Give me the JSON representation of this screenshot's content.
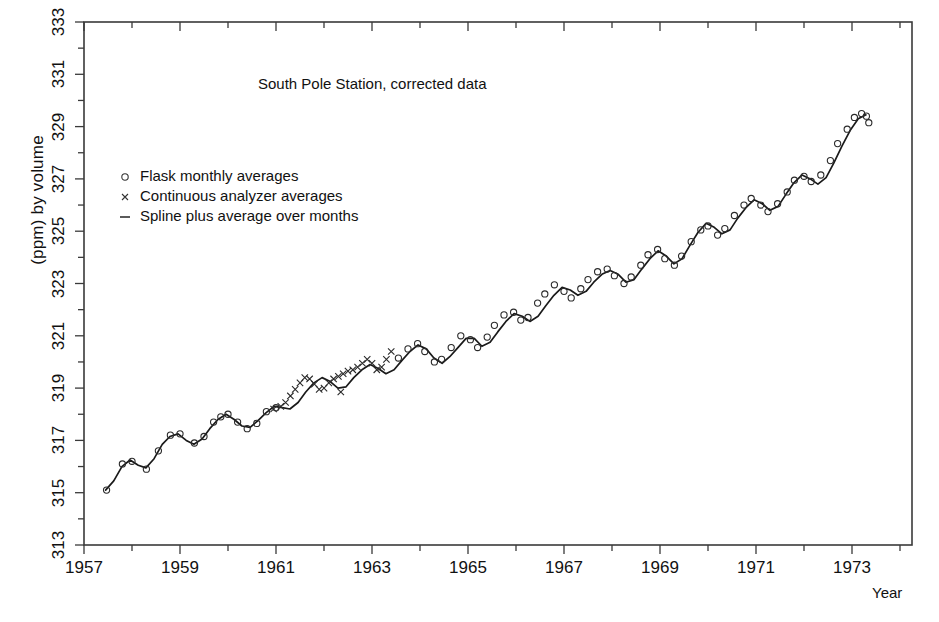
{
  "chart_data": {
    "type": "line",
    "title": "South Pole Station, corrected data",
    "xlabel": "Year",
    "ylabel": "(ppm) by volume",
    "xlim": [
      1957.0,
      1974.25
    ],
    "ylim": [
      313,
      333
    ],
    "grid": false,
    "legend_position": "upper-left-inside",
    "x_major_ticks": [
      1957,
      1959,
      1961,
      1963,
      1965,
      1967,
      1969,
      1971,
      1973
    ],
    "x_minor_ticks": [
      1958,
      1960,
      1962,
      1964,
      1966,
      1968,
      1970,
      1972,
      1974
    ],
    "y_major_ticks": [
      313,
      315,
      317,
      319,
      321,
      323,
      325,
      327,
      329,
      331,
      333
    ],
    "y_minor_ticks": [
      314,
      316,
      318,
      320,
      322,
      324,
      326,
      328,
      330,
      332
    ],
    "legend": [
      {
        "marker": "circle",
        "label": "Flask monthly averages"
      },
      {
        "marker": "cross",
        "label": "Continuous analyzer averages"
      },
      {
        "marker": "dash",
        "label": "Spline plus average over months"
      }
    ],
    "series": [
      {
        "name": "Spline plus average over months",
        "marker": "none",
        "style": "solid-line",
        "x": [
          1957.45,
          1957.62,
          1957.79,
          1957.96,
          1958.13,
          1958.29,
          1958.46,
          1958.63,
          1958.79,
          1958.96,
          1959.13,
          1959.29,
          1959.46,
          1959.62,
          1959.79,
          1959.96,
          1960.13,
          1960.29,
          1960.46,
          1960.62,
          1960.79,
          1960.96,
          1961.13,
          1961.29,
          1961.46,
          1961.62,
          1961.79,
          1961.96,
          1962.13,
          1962.29,
          1962.46,
          1962.62,
          1962.79,
          1962.96,
          1963.13,
          1963.29,
          1963.46,
          1963.62,
          1963.79,
          1963.96,
          1964.13,
          1964.29,
          1964.46,
          1964.62,
          1964.79,
          1964.96,
          1965.13,
          1965.29,
          1965.46,
          1965.62,
          1965.79,
          1965.96,
          1966.13,
          1966.29,
          1966.46,
          1966.62,
          1966.79,
          1966.96,
          1967.13,
          1967.29,
          1967.46,
          1967.62,
          1967.79,
          1967.96,
          1968.13,
          1968.29,
          1968.46,
          1968.62,
          1968.79,
          1968.96,
          1969.13,
          1969.29,
          1969.46,
          1969.62,
          1969.79,
          1969.96,
          1970.13,
          1970.29,
          1970.46,
          1970.62,
          1970.79,
          1970.96,
          1971.13,
          1971.29,
          1971.46,
          1971.62,
          1971.79,
          1971.96,
          1972.13,
          1972.29,
          1972.46,
          1972.62,
          1972.79,
          1972.96,
          1973.13,
          1973.29
        ],
        "y": [
          315.1,
          315.45,
          316.0,
          316.25,
          316.05,
          315.95,
          316.3,
          316.85,
          317.15,
          317.25,
          317.0,
          316.85,
          317.05,
          317.45,
          317.8,
          318.0,
          317.8,
          317.55,
          317.5,
          317.75,
          318.05,
          318.3,
          318.25,
          318.2,
          318.45,
          318.85,
          319.2,
          319.4,
          319.25,
          319.0,
          319.05,
          319.4,
          319.7,
          319.9,
          319.75,
          319.55,
          319.7,
          320.05,
          320.4,
          320.65,
          320.5,
          320.15,
          319.95,
          320.2,
          320.55,
          320.9,
          320.9,
          320.6,
          320.75,
          321.15,
          321.55,
          321.85,
          321.75,
          321.55,
          321.75,
          322.15,
          322.55,
          322.85,
          322.75,
          322.55,
          322.7,
          323.05,
          323.35,
          323.5,
          323.35,
          323.05,
          323.15,
          323.55,
          323.95,
          324.25,
          324.05,
          323.75,
          323.95,
          324.45,
          324.95,
          325.3,
          325.15,
          324.9,
          325.05,
          325.5,
          325.9,
          326.2,
          326.05,
          325.8,
          325.95,
          326.4,
          326.85,
          327.15,
          327.0,
          326.8,
          327.05,
          327.6,
          328.25,
          328.85,
          329.3,
          329.45
        ]
      },
      {
        "name": "Flask monthly averages",
        "marker": "circle",
        "x": [
          1957.47,
          1957.8,
          1958.0,
          1958.3,
          1958.55,
          1958.8,
          1959.0,
          1959.3,
          1959.5,
          1959.7,
          1959.85,
          1960.0,
          1960.2,
          1960.4,
          1960.6,
          1960.8,
          1961.0,
          1963.55,
          1963.75,
          1963.95,
          1964.1,
          1964.3,
          1964.45,
          1964.65,
          1964.85,
          1965.05,
          1965.2,
          1965.4,
          1965.55,
          1965.75,
          1965.95,
          1966.1,
          1966.25,
          1966.45,
          1966.6,
          1966.8,
          1967.0,
          1967.15,
          1967.35,
          1967.5,
          1967.7,
          1967.9,
          1968.05,
          1968.25,
          1968.4,
          1968.6,
          1968.75,
          1968.95,
          1969.1,
          1969.3,
          1969.45,
          1969.65,
          1969.85,
          1970.0,
          1970.2,
          1970.35,
          1970.55,
          1970.75,
          1970.9,
          1971.1,
          1971.25,
          1971.45,
          1971.65,
          1971.8,
          1972.0,
          1972.15,
          1972.35,
          1972.55,
          1972.7,
          1972.9,
          1973.05,
          1973.2,
          1973.3,
          1973.35
        ],
        "y": [
          315.1,
          316.1,
          316.2,
          315.9,
          316.6,
          317.2,
          317.25,
          316.9,
          317.15,
          317.7,
          317.9,
          318.0,
          317.7,
          317.45,
          317.65,
          318.1,
          318.25,
          320.15,
          320.5,
          320.7,
          320.4,
          320.0,
          320.1,
          320.55,
          321.0,
          320.85,
          320.55,
          320.95,
          321.4,
          321.8,
          321.9,
          321.6,
          321.7,
          322.25,
          322.6,
          322.95,
          322.7,
          322.45,
          322.8,
          323.15,
          323.45,
          323.55,
          323.3,
          323.0,
          323.25,
          323.7,
          324.1,
          324.3,
          323.95,
          323.7,
          324.05,
          324.6,
          325.05,
          325.2,
          324.85,
          325.1,
          325.6,
          326.0,
          326.25,
          326.0,
          325.75,
          326.05,
          326.5,
          326.95,
          327.1,
          326.9,
          327.15,
          327.7,
          328.35,
          328.9,
          329.35,
          329.5,
          329.4,
          329.15
        ]
      },
      {
        "name": "Continuous analyzer averages",
        "marker": "cross",
        "x": [
          1960.95,
          1961.1,
          1961.2,
          1961.3,
          1961.4,
          1961.5,
          1961.6,
          1961.7,
          1961.8,
          1961.9,
          1962.0,
          1962.1,
          1962.2,
          1962.3,
          1962.4,
          1962.5,
          1962.6,
          1962.7,
          1962.8,
          1962.9,
          1963.0,
          1963.1,
          1963.2,
          1963.3,
          1963.4,
          1962.35
        ],
        "y": [
          318.2,
          318.3,
          318.45,
          318.7,
          318.95,
          319.2,
          319.4,
          319.35,
          319.15,
          318.95,
          319.0,
          319.2,
          319.35,
          319.45,
          319.55,
          319.65,
          319.7,
          319.8,
          319.95,
          320.1,
          319.95,
          319.7,
          319.8,
          320.1,
          320.4,
          318.85
        ]
      }
    ]
  },
  "axes": {
    "y_labels": [
      "313",
      "315",
      "317",
      "319",
      "321",
      "323",
      "325",
      "327",
      "329",
      "331",
      "333"
    ],
    "x_labels": [
      "1957",
      "1959",
      "1961",
      "1963",
      "1965",
      "1967",
      "1969",
      "1971",
      "1973"
    ]
  }
}
